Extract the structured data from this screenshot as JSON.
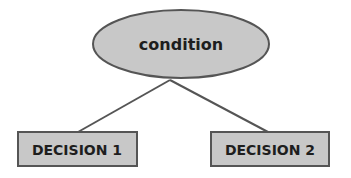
{
  "diagram": {
    "type": "decision-tree",
    "root": {
      "label": "condition",
      "shape": "ellipse"
    },
    "children": [
      {
        "label": "DECISION 1",
        "shape": "rectangle"
      },
      {
        "label": "DECISION 2",
        "shape": "rectangle"
      }
    ],
    "edges": [
      {
        "from": "condition",
        "to": "DECISION 1"
      },
      {
        "from": "condition",
        "to": "DECISION 2"
      }
    ],
    "colors": {
      "fill": "#c8c8c8",
      "stroke": "#555555",
      "text": "#1e1e1e",
      "background": "#ffffff"
    }
  }
}
